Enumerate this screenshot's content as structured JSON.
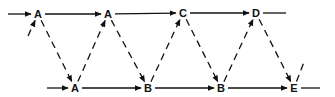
{
  "diagram": {
    "type": "sequential-state-lattice",
    "color": "#111111",
    "background": "#ffffff",
    "nodes": [
      {
        "id": "t1",
        "label": "A",
        "x": 38,
        "y": 14,
        "row": "top"
      },
      {
        "id": "t2",
        "label": "A",
        "x": 108,
        "y": 14,
        "row": "top"
      },
      {
        "id": "t3",
        "label": "C",
        "x": 183,
        "y": 13,
        "row": "top"
      },
      {
        "id": "t4",
        "label": "D",
        "x": 256,
        "y": 13,
        "row": "top"
      },
      {
        "id": "b1",
        "label": "A",
        "x": 75,
        "y": 88,
        "row": "bottom"
      },
      {
        "id": "b2",
        "label": "B",
        "x": 148,
        "y": 88,
        "row": "bottom"
      },
      {
        "id": "b3",
        "label": "B",
        "x": 221,
        "y": 88,
        "row": "bottom"
      },
      {
        "id": "b4",
        "label": "E",
        "x": 294,
        "y": 88,
        "row": "bottom"
      }
    ],
    "edges": [
      {
        "from": "in-top",
        "to": "t1",
        "style": "solid",
        "arrow": true
      },
      {
        "from": "t1",
        "to": "t2",
        "style": "solid",
        "arrow": true
      },
      {
        "from": "t2",
        "to": "t3",
        "style": "solid",
        "arrow": true
      },
      {
        "from": "t3",
        "to": "t4",
        "style": "solid",
        "arrow": true
      },
      {
        "from": "t4",
        "to": "out-top",
        "style": "solid",
        "arrow": false
      },
      {
        "from": "in-bottom",
        "to": "b1",
        "style": "solid",
        "arrow": true
      },
      {
        "from": "b1",
        "to": "b2",
        "style": "solid",
        "arrow": true
      },
      {
        "from": "b2",
        "to": "b3",
        "style": "solid",
        "arrow": true
      },
      {
        "from": "b3",
        "to": "b4",
        "style": "solid",
        "arrow": true
      },
      {
        "from": "b4",
        "to": "out-bottom",
        "style": "solid",
        "arrow": false
      },
      {
        "from": "in-diag",
        "to": "t1",
        "style": "dashed",
        "arrow": true
      },
      {
        "from": "t1",
        "to": "b1",
        "style": "dashed",
        "arrow": true
      },
      {
        "from": "b1",
        "to": "t2",
        "style": "dashed",
        "arrow": true
      },
      {
        "from": "t2",
        "to": "b2",
        "style": "dashed",
        "arrow": true
      },
      {
        "from": "b2",
        "to": "t3",
        "style": "dashed",
        "arrow": true
      },
      {
        "from": "t3",
        "to": "b3",
        "style": "dashed",
        "arrow": true
      },
      {
        "from": "b3",
        "to": "t4",
        "style": "dashed",
        "arrow": true
      },
      {
        "from": "t4",
        "to": "b4",
        "style": "dashed",
        "arrow": true
      },
      {
        "from": "b4",
        "to": "out-diag",
        "style": "dashed",
        "arrow": false
      }
    ]
  }
}
